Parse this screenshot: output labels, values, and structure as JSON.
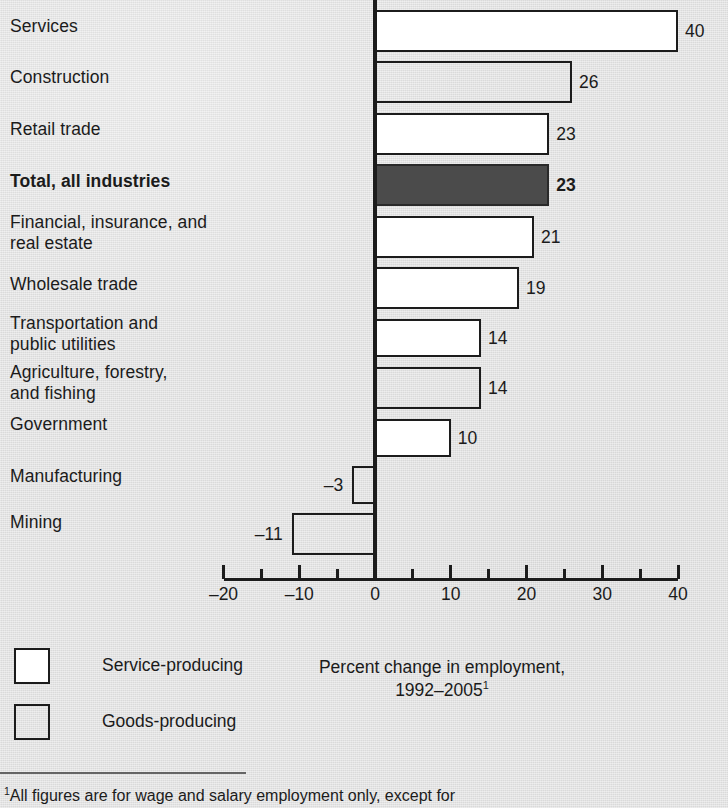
{
  "chart_data": {
    "type": "bar",
    "orientation": "horizontal",
    "title": "",
    "xlabel": "Percent change in employment, 1992–2005",
    "ylabel": "",
    "xlim": [
      -20,
      40
    ],
    "xticks": [
      -20,
      -10,
      0,
      10,
      20,
      30,
      40
    ],
    "xtick_labels": [
      "–20",
      "–10",
      "0",
      "10",
      "20",
      "30",
      "40"
    ],
    "minor_tick_step": 5,
    "grid": false,
    "legend_position": "below-left",
    "categories": [
      "Services",
      "Construction",
      "Retail trade",
      "Total, all industries",
      "Financial, insurance, and real estate",
      "Wholesale trade",
      "Transportation and public utilities",
      "Agriculture, forestry, and fishing",
      "Government",
      "Manufacturing",
      "Mining"
    ],
    "values": [
      40,
      26,
      23,
      23,
      21,
      19,
      14,
      14,
      10,
      -3,
      -11
    ],
    "value_labels": [
      "40",
      "26",
      "23",
      "23",
      "21",
      "19",
      "14",
      "14",
      "10",
      "–3",
      "–11"
    ],
    "groups": [
      "service",
      "goods",
      "service",
      "total",
      "service",
      "service",
      "service",
      "goods",
      "service",
      "goods",
      "goods"
    ]
  },
  "rows": [
    {
      "label": "Services",
      "label_lines": "Services",
      "value": 40,
      "value_label": "40",
      "group": "service",
      "bold": false
    },
    {
      "label": "Construction",
      "label_lines": "Construction",
      "value": 26,
      "value_label": "26",
      "group": "goods",
      "bold": false
    },
    {
      "label": "Retail trade",
      "label_lines": "Retail trade",
      "value": 23,
      "value_label": "23",
      "group": "service",
      "bold": false
    },
    {
      "label": "Total, all industries",
      "label_lines": "Total, all industries",
      "value": 23,
      "value_label": "23",
      "group": "total",
      "bold": true
    },
    {
      "label": "Financial, insurance, and real estate",
      "label_lines": "Financial, insurance, and\nreal estate",
      "value": 21,
      "value_label": "21",
      "group": "service",
      "bold": false
    },
    {
      "label": "Wholesale trade",
      "label_lines": "Wholesale trade",
      "value": 19,
      "value_label": "19",
      "group": "service",
      "bold": false
    },
    {
      "label": "Transportation and public utilities",
      "label_lines": "Transportation and\npublic utilities",
      "value": 14,
      "value_label": "14",
      "group": "service",
      "bold": false
    },
    {
      "label": "Agriculture, forestry, and fishing",
      "label_lines": "Agriculture, forestry,\nand fishing",
      "value": 14,
      "value_label": "14",
      "group": "goods",
      "bold": false
    },
    {
      "label": "Government",
      "label_lines": "Government",
      "value": 10,
      "value_label": "10",
      "group": "service",
      "bold": false
    },
    {
      "label": "Manufacturing",
      "label_lines": "Manufacturing",
      "value": -3,
      "value_label": "–3",
      "group": "goods",
      "bold": false
    },
    {
      "label": "Mining",
      "label_lines": "Mining",
      "value": -11,
      "value_label": "–11",
      "group": "goods",
      "bold": false
    }
  ],
  "axis": {
    "tick_labels": [
      "–20",
      "–10",
      "0",
      "10",
      "20",
      "30",
      "40"
    ],
    "tick_values": [
      -20,
      -10,
      0,
      10,
      20,
      30,
      40
    ]
  },
  "legend": {
    "items": [
      {
        "label": "Service-producing",
        "swatch": "service"
      },
      {
        "label": "Goods-producing",
        "swatch": "goods"
      }
    ]
  },
  "caption": {
    "line1": "Percent change in employment,",
    "line2": "1992–2005",
    "marker": "1"
  },
  "footnote": {
    "marker": "1",
    "text": "All figures are for wage and salary employment only, except for"
  },
  "colors": {
    "background": "#e3e3e3",
    "ink": "#1c1c1c",
    "service_fill": "#ffffff",
    "goods_fill": "#e3e3e3",
    "total_fill": "#4b4b4b"
  }
}
